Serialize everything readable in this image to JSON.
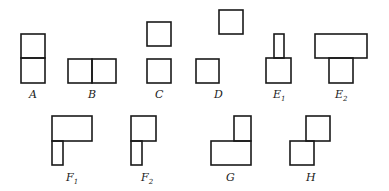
{
  "title": "",
  "figures": [
    {
      "id": "A",
      "label": "A",
      "sub": "",
      "lx": 29,
      "ly": 98,
      "rects": [
        [
          21,
          34,
          24,
          24
        ],
        [
          21,
          58,
          24,
          25
        ]
      ]
    },
    {
      "id": "B",
      "label": "B",
      "sub": "",
      "lx": 88,
      "ly": 98,
      "rects": [
        [
          68,
          59,
          24,
          24
        ],
        [
          92,
          59,
          24,
          24
        ]
      ]
    },
    {
      "id": "C",
      "label": "C",
      "sub": "",
      "lx": 155,
      "ly": 98,
      "rects": [
        [
          147,
          22,
          24,
          24
        ],
        [
          147,
          59,
          24,
          24
        ]
      ]
    },
    {
      "id": "D",
      "label": "D",
      "sub": "",
      "lx": 214,
      "ly": 98,
      "rects": [
        [
          196,
          59,
          23,
          24
        ],
        [
          219,
          10,
          24,
          24
        ]
      ]
    },
    {
      "id": "E1",
      "label": "E",
      "sub": "1",
      "lx": 273,
      "ly": 98,
      "rects": [
        [
          274,
          34,
          10,
          24
        ],
        [
          266,
          58,
          25,
          25
        ]
      ]
    },
    {
      "id": "E2",
      "label": "E",
      "sub": "2",
      "lx": 335,
      "ly": 98,
      "rects": [
        [
          315,
          34,
          52,
          24
        ],
        [
          329,
          58,
          24,
          25
        ]
      ]
    },
    {
      "id": "F1",
      "label": "F",
      "sub": "1",
      "lx": 66,
      "ly": 181,
      "rects": [
        [
          52,
          116,
          40,
          25
        ],
        [
          52,
          141,
          11,
          24
        ]
      ]
    },
    {
      "id": "F2",
      "label": "F",
      "sub": "2",
      "lx": 141,
      "ly": 181,
      "rects": [
        [
          131,
          116,
          25,
          25
        ],
        [
          131,
          141,
          11,
          24
        ]
      ]
    },
    {
      "id": "G",
      "label": "G",
      "sub": "",
      "lx": 226,
      "ly": 181,
      "rects": [
        [
          234,
          116,
          17,
          25
        ],
        [
          211,
          141,
          40,
          24
        ]
      ]
    },
    {
      "id": "H",
      "label": "H",
      "sub": "",
      "lx": 306,
      "ly": 181,
      "rects": [
        [
          306,
          116,
          24,
          25
        ],
        [
          290,
          141,
          24,
          24
        ]
      ]
    }
  ]
}
